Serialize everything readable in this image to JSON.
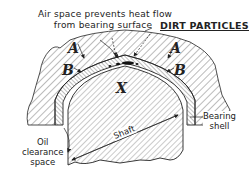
{
  "diagram": {
    "caption_line1": "Air space prevents heat flow",
    "caption_line2": "from bearing surface",
    "dirt_label": "DIRT PARTICLES",
    "labels": {
      "a_left": "A",
      "a_right": "A",
      "b_left": "B",
      "b_right": "B",
      "x": "X",
      "bearing_line1": "Bearing",
      "bearing_line2": "shell",
      "oil_line1": "Oil",
      "oil_line2": "clearance",
      "oil_line3": "space",
      "shaft": "Shaft"
    },
    "colors": {
      "ink": "#222222",
      "background": "#ffffff",
      "hatch": "#555555"
    }
  }
}
